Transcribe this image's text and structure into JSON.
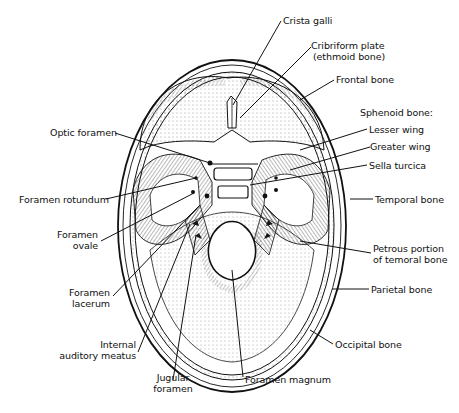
{
  "diagram": {
    "colors": {
      "ink": "#111111",
      "paper": "#ffffff",
      "shade": "#555555"
    },
    "labels": {
      "crista_galli": "Crista galli",
      "cribriform_1": "Cribriform plate",
      "cribriform_2": "(ethmoid bone)",
      "frontal": "Frontal bone",
      "sphenoid": "Sphenoid bone:",
      "lesser_wing": "Lesser wing",
      "greater_wing": "Greater wing",
      "sella": "Sella turcica",
      "temporal": "Temporal bone",
      "petrous_1": "Petrous portion",
      "petrous_2": "of temoral bone",
      "parietal": "Parietal bone",
      "occipital": "Occipital bone",
      "magnum": "Foramen magnum",
      "jugular_1": "Jugular",
      "jugular_2": "foramen",
      "internal_1": "Internal",
      "internal_2": "auditory meatus",
      "lacerum_1": "Foramen",
      "lacerum_2": "lacerum",
      "ovale_1": "Foramen",
      "ovale_2": "ovale",
      "rotundum": "Foramen rotundum",
      "optic": "Optic foramen"
    }
  }
}
